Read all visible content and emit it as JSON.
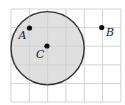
{
  "diagram": {
    "type": "grid-with-circle",
    "grid": {
      "columns": 6,
      "rows": 5,
      "origin_px": [
        11,
        9
      ],
      "cell_px": 18.3,
      "line_color": "#d4d4d4"
    },
    "circle": {
      "center_label": "C",
      "center_grid": [
        2,
        2
      ],
      "radius_cells": 2,
      "fill_color": "#d9d9d9",
      "stroke_color": "#333333"
    },
    "points": [
      {
        "label": "A",
        "grid": [
          1,
          1
        ],
        "inside_circle": true
      },
      {
        "label": "B",
        "grid": [
          5,
          1
        ],
        "inside_circle": false
      },
      {
        "label": "C",
        "grid": [
          2,
          2
        ],
        "inside_circle": true
      }
    ]
  }
}
